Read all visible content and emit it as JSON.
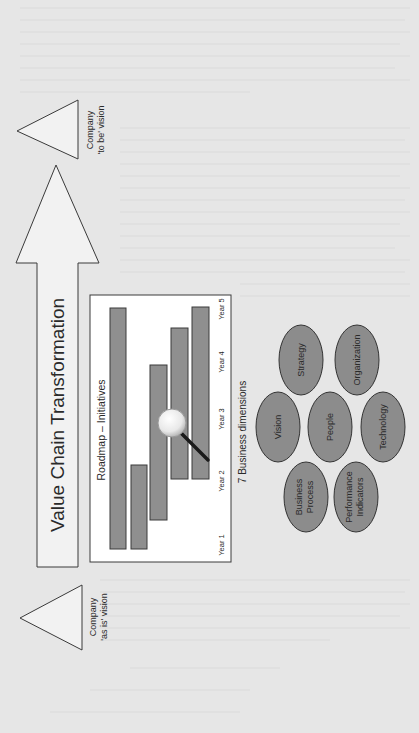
{
  "diagram": {
    "title": "Value Chain Transformation",
    "orientation": "rotated 90° counter-clockwise",
    "start_state": {
      "line1": "Company",
      "line2": "'as is' vision"
    },
    "end_state": {
      "line1": "Company",
      "line2": "'to be' vision"
    },
    "roadmap": {
      "title": "Roadmap – Initiatives",
      "years": [
        "Year 1",
        "Year 2",
        "Year 3",
        "Year 4",
        "Year 5"
      ],
      "initiatives": [
        {
          "name": "Initiative 1",
          "start_year": 1.0,
          "end_year": 5.0
        },
        {
          "name": "Initiative 2",
          "start_year": 1.0,
          "end_year": 2.3
        },
        {
          "name": "Initiative 3",
          "start_year": 1.5,
          "end_year": 3.9
        },
        {
          "name": "Initiative 4",
          "start_year": 2.0,
          "end_year": 4.4
        },
        {
          "name": "Initiative 5",
          "start_year": 2.0,
          "end_year": 5.0
        }
      ],
      "magnifier_icon": "magnifying-glass-icon"
    },
    "dimensions": {
      "title": "7 Business dimensions",
      "items": [
        {
          "label1": "Strategy",
          "label2": ""
        },
        {
          "label1": "Organization",
          "label2": ""
        },
        {
          "label1": "Vision",
          "label2": ""
        },
        {
          "label1": "People",
          "label2": ""
        },
        {
          "label1": "Technology",
          "label2": ""
        },
        {
          "label1": "Business",
          "label2": "Process"
        },
        {
          "label1": "Performance",
          "label2": "Indicators"
        }
      ]
    },
    "colors": {
      "background": "#e6e6e6",
      "shape_fill": "#f2f2f2",
      "bar_fill": "#8f8f8f",
      "ellipse_fill": "#8c8c8c",
      "stroke": "#3a3a3a"
    }
  }
}
